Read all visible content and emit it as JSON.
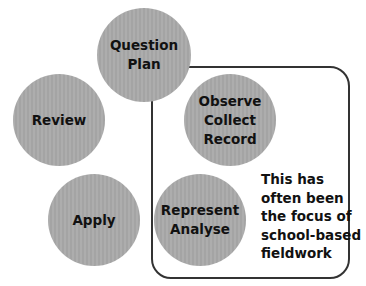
{
  "diagram": {
    "colors": {
      "circle_fill": "#a9a9a9",
      "text": "#111111",
      "box_border": "#333333",
      "background": "#ffffff"
    },
    "stages": [
      {
        "id": "question-plan",
        "label": "Question\nPlan"
      },
      {
        "id": "observe-collect-record",
        "label": "Observe\nCollect\nRecord"
      },
      {
        "id": "represent-analyse",
        "label": "Represent\nAnalyse"
      },
      {
        "id": "apply",
        "label": "Apply"
      },
      {
        "id": "review",
        "label": "Review"
      }
    ],
    "focus_box": {
      "note_lines": [
        "This has",
        "often been",
        "the focus of",
        "school-based",
        "fieldwork"
      ]
    }
  }
}
